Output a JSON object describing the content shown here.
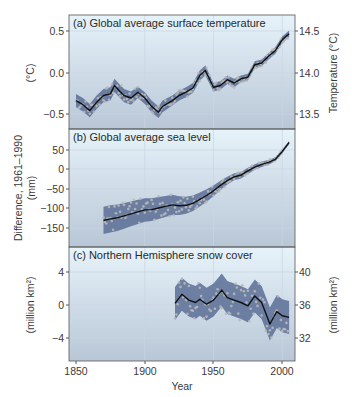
{
  "figure": {
    "xlabel": "Year",
    "x_ticks": [
      "1850",
      "1900",
      "1950",
      "2000"
    ]
  },
  "panels": {
    "a": {
      "title": "(a) Global average surface temperature",
      "ylabel_left": "(°C)",
      "ylabel_right": "Temperature (°C)",
      "left_ticks": [
        "0.5",
        "0.0",
        "−0.5"
      ],
      "right_ticks": [
        "14.5",
        "14.0",
        "13.5"
      ]
    },
    "b": {
      "title": "(b) Global average sea level",
      "ylabel_left_line1": "Difference, 1961–1990",
      "ylabel_left_line2": "(mm)",
      "left_ticks": [
        "50",
        "0",
        "−50",
        "−100",
        "−150"
      ]
    },
    "c": {
      "title": "(c) Northern Hemisphere snow cover",
      "ylabel_left": "(million km²)",
      "ylabel_right": "(million km²)",
      "left_ticks": [
        "4",
        "0",
        "−4"
      ],
      "right_ticks": [
        "40",
        "36",
        "32"
      ]
    }
  },
  "colors": {
    "panel_bg_top": "#e6f3fa",
    "panel_bg_bottom": "#b9c6d6",
    "uncertainty_band": "#5a6f96",
    "data_points": "#b8b8b8",
    "smoothed_line": "#111111",
    "grid": "#c9d6e2",
    "border": "#555555"
  },
  "chart_data": [
    {
      "type": "line",
      "title": "(a) Global average surface temperature",
      "xlabel": "Year",
      "ylabel": "(°C)",
      "ylabel_right": "Temperature (°C)",
      "xlim": [
        1845,
        2010
      ],
      "ylim": [
        -0.7,
        0.65
      ],
      "ylim_right": [
        13.3,
        14.65
      ],
      "grid": true,
      "x": [
        1850,
        1855,
        1860,
        1865,
        1870,
        1875,
        1878,
        1882,
        1885,
        1890,
        1895,
        1900,
        1905,
        1910,
        1913,
        1920,
        1925,
        1930,
        1935,
        1940,
        1944,
        1950,
        1955,
        1960,
        1965,
        1970,
        1975,
        1980,
        1985,
        1990,
        1995,
        2000,
        2005
      ],
      "series": [
        {
          "name": "Smoothed annual mean",
          "values": [
            -0.33,
            -0.38,
            -0.45,
            -0.35,
            -0.27,
            -0.25,
            -0.15,
            -0.22,
            -0.27,
            -0.3,
            -0.23,
            -0.3,
            -0.4,
            -0.47,
            -0.4,
            -0.33,
            -0.27,
            -0.23,
            -0.18,
            -0.03,
            0.03,
            -0.17,
            -0.15,
            -0.08,
            -0.12,
            -0.07,
            -0.05,
            0.1,
            0.12,
            0.2,
            0.27,
            0.4,
            0.47
          ]
        },
        {
          "name": "Uncertainty half-width",
          "values": [
            0.08,
            0.08,
            0.08,
            0.08,
            0.08,
            0.08,
            0.08,
            0.08,
            0.08,
            0.08,
            0.07,
            0.07,
            0.07,
            0.07,
            0.07,
            0.06,
            0.06,
            0.06,
            0.06,
            0.06,
            0.06,
            0.05,
            0.05,
            0.05,
            0.05,
            0.04,
            0.04,
            0.04,
            0.04,
            0.04,
            0.04,
            0.04,
            0.04
          ]
        }
      ]
    },
    {
      "type": "line",
      "title": "(b) Global average sea level",
      "xlabel": "Year",
      "ylabel": "Difference, 1961–1990 (mm)",
      "xlim": [
        1845,
        2010
      ],
      "ylim": [
        -190,
        90
      ],
      "grid": true,
      "x": [
        1870,
        1875,
        1880,
        1885,
        1890,
        1895,
        1900,
        1905,
        1910,
        1915,
        1920,
        1925,
        1930,
        1935,
        1940,
        1945,
        1950,
        1955,
        1960,
        1965,
        1970,
        1975,
        1980,
        1985,
        1990,
        1995,
        2000,
        2005
      ],
      "series": [
        {
          "name": "Smoothed annual mean",
          "values": [
            -132,
            -128,
            -125,
            -120,
            -115,
            -110,
            -105,
            -104,
            -100,
            -96,
            -92,
            -94,
            -93,
            -88,
            -78,
            -68,
            -56,
            -42,
            -30,
            -20,
            -16,
            -5,
            5,
            12,
            17,
            25,
            45,
            68
          ]
        },
        {
          "name": "Uncertainty half-width",
          "values": [
            35,
            35,
            34,
            33,
            32,
            31,
            30,
            29,
            28,
            27,
            26,
            24,
            22,
            20,
            18,
            16,
            14,
            12,
            10,
            9,
            8,
            8,
            7,
            7,
            6,
            5,
            5,
            4
          ]
        }
      ]
    },
    {
      "type": "line",
      "title": "(c) Northern Hemisphere snow cover",
      "xlabel": "Year",
      "ylabel": "(million km²)",
      "ylabel_right": "(million km²)",
      "xlim": [
        1845,
        2010
      ],
      "ylim": [
        -6.8,
        6.5
      ],
      "ylim_right": [
        29.2,
        42.5
      ],
      "grid": true,
      "x": [
        1922,
        1927,
        1932,
        1937,
        1940,
        1945,
        1950,
        1956,
        1960,
        1965,
        1970,
        1975,
        1980,
        1985,
        1988,
        1991,
        1996,
        2000,
        2005
      ],
      "series": [
        {
          "name": "Smoothed annual mean",
          "values": [
            0.2,
            1.3,
            0.6,
            0.3,
            0.7,
            0.1,
            0.6,
            1.8,
            0.9,
            0.6,
            0.3,
            -0.1,
            1.1,
            0.3,
            -1.0,
            -2.3,
            -0.8,
            -1.3,
            -1.5
          ]
        },
        {
          "name": "Uncertainty half-width",
          "values": [
            2.0,
            2.0,
            2.0,
            2.0,
            2.0,
            2.0,
            2.0,
            2.0,
            2.0,
            2.0,
            2.0,
            2.0,
            2.0,
            2.0,
            2.0,
            2.0,
            2.0,
            2.0,
            2.0
          ]
        }
      ]
    }
  ]
}
